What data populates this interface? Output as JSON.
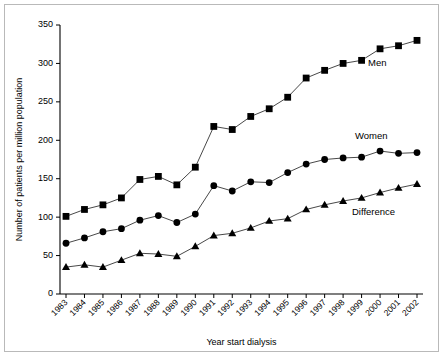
{
  "chart_data": {
    "type": "line",
    "title": "",
    "xlabel": "Year start dialysis",
    "ylabel": "Number of patients per million population",
    "categories": [
      "1983",
      "1984",
      "1985",
      "1986",
      "1987",
      "1988",
      "1989",
      "1990",
      "1991",
      "1992",
      "1993",
      "1994",
      "1995",
      "1996",
      "1997",
      "1998",
      "1999",
      "2000",
      "2001",
      "2002"
    ],
    "ylim": [
      0,
      350
    ],
    "yticks": [
      0,
      50,
      100,
      150,
      200,
      250,
      300,
      350
    ],
    "grid": false,
    "legend_position": "inline-right",
    "series": [
      {
        "name": "Men",
        "marker": "square",
        "color": "#000000",
        "values": [
          101,
          110,
          116,
          125,
          149,
          153,
          142,
          165,
          218,
          214,
          231,
          241,
          256,
          281,
          291,
          300,
          304,
          319,
          323,
          330
        ]
      },
      {
        "name": "Women",
        "marker": "circle",
        "color": "#000000",
        "values": [
          66,
          73,
          81,
          85,
          96,
          102,
          93,
          104,
          141,
          134,
          146,
          145,
          158,
          169,
          175,
          177,
          178,
          186,
          183,
          184
        ]
      },
      {
        "name": "Difference",
        "marker": "triangle",
        "color": "#000000",
        "values": [
          35,
          38,
          35,
          44,
          53,
          52,
          49,
          62,
          76,
          79,
          86,
          95,
          98,
          110,
          116,
          121,
          125,
          132,
          138,
          143
        ]
      }
    ],
    "annotations": [
      {
        "text": "Men",
        "x": 2000.3,
        "y": 290
      },
      {
        "text": "Women",
        "x": 1999.6,
        "y": 205
      },
      {
        "text": "Difference",
        "x": 1999.5,
        "y": 106
      }
    ]
  }
}
